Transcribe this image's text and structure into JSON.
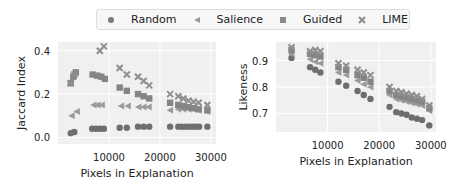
{
  "legend": {
    "items": [
      {
        "label": "Random",
        "marker": "circle"
      },
      {
        "label": "Salience",
        "marker": "triangle-left"
      },
      {
        "label": "Guided",
        "marker": "square"
      },
      {
        "label": "LIME",
        "marker": "x"
      }
    ]
  },
  "colors": {
    "marker": "#7a7a7a",
    "plot_bg": "#f0f0f0",
    "grid": "#ffffff"
  },
  "chart_data": [
    {
      "type": "scatter",
      "title": "",
      "xlabel": "Pixels in Explanation",
      "ylabel": "Jaccard Index",
      "xticks": [
        10000,
        20000,
        30000
      ],
      "yticks": [
        0.0,
        0.2,
        0.4
      ],
      "xlim": [
        0,
        31000
      ],
      "ylim": [
        -0.03,
        0.44
      ],
      "grid": true,
      "series": [
        {
          "name": "Random",
          "marker": "circle",
          "x": [
            2500,
            3200,
            6700,
            7500,
            8300,
            9000,
            12100,
            13500,
            15700,
            16800,
            17900,
            22000,
            23600,
            24300,
            25000,
            25700,
            26400,
            27000,
            27700,
            29300
          ],
          "y": [
            0.02,
            0.025,
            0.04,
            0.04,
            0.04,
            0.04,
            0.045,
            0.045,
            0.05,
            0.05,
            0.05,
            0.05,
            0.05,
            0.05,
            0.05,
            0.05,
            0.05,
            0.05,
            0.05,
            0.05
          ]
        },
        {
          "name": "Salience",
          "marker": "triangle-left",
          "x": [
            2700,
            3700,
            7000,
            7800,
            8600,
            12400,
            13700,
            15800,
            16800,
            17800,
            22000,
            23600,
            24600,
            25600,
            26600,
            27600,
            29300
          ],
          "y": [
            0.1,
            0.12,
            0.15,
            0.15,
            0.15,
            0.145,
            0.145,
            0.14,
            0.14,
            0.14,
            0.125,
            0.13,
            0.13,
            0.13,
            0.13,
            0.125,
            0.12
          ]
        },
        {
          "name": "Guided",
          "marker": "square",
          "x": [
            2500,
            3000,
            3500,
            6800,
            7700,
            8500,
            9200,
            12100,
            13500,
            15700,
            16800,
            17900,
            22000,
            23600,
            24600,
            25600,
            26600,
            27600,
            29300
          ],
          "y": [
            0.25,
            0.28,
            0.3,
            0.29,
            0.285,
            0.28,
            0.27,
            0.23,
            0.215,
            0.2,
            0.19,
            0.18,
            0.16,
            0.15,
            0.145,
            0.14,
            0.135,
            0.13,
            0.125
          ]
        },
        {
          "name": "LIME",
          "marker": "x",
          "x": [
            2500,
            3200,
            8200,
            9000,
            12100,
            13500,
            15700,
            16800,
            17900,
            22000,
            23600,
            24600,
            25600,
            26600,
            27600,
            29300
          ],
          "y": [
            0.25,
            0.29,
            0.4,
            0.42,
            0.32,
            0.29,
            0.28,
            0.26,
            0.24,
            0.2,
            0.19,
            0.18,
            0.17,
            0.165,
            0.16,
            0.15
          ]
        }
      ]
    },
    {
      "type": "scatter",
      "title": "",
      "xlabel": "Pixels in Explanation",
      "ylabel": "Likeness",
      "xticks": [
        10000,
        20000,
        30000
      ],
      "yticks": [
        0.7,
        0.8,
        0.9
      ],
      "xlim": [
        0,
        31000
      ],
      "ylim": [
        0.63,
        0.97
      ],
      "grid": true,
      "series": [
        {
          "name": "Random",
          "marker": "circle",
          "x": [
            3000,
            6600,
            7600,
            8600,
            12100,
            13600,
            15800,
            17000,
            18300,
            22000,
            23300,
            24300,
            25300,
            26300,
            27300,
            28300,
            29700
          ],
          "y": [
            0.91,
            0.875,
            0.865,
            0.855,
            0.82,
            0.805,
            0.785,
            0.77,
            0.755,
            0.725,
            0.705,
            0.7,
            0.695,
            0.685,
            0.68,
            0.675,
            0.655
          ]
        },
        {
          "name": "Salience",
          "marker": "triangle-left",
          "x": [
            3000,
            6600,
            7600,
            8600,
            12100,
            13600,
            15800,
            17000,
            18300,
            22000,
            23300,
            24300,
            25300,
            26300,
            27300,
            28300,
            29700
          ],
          "y": [
            0.925,
            0.905,
            0.895,
            0.89,
            0.855,
            0.845,
            0.825,
            0.81,
            0.8,
            0.77,
            0.755,
            0.75,
            0.745,
            0.74,
            0.735,
            0.73,
            0.71
          ]
        },
        {
          "name": "Guided",
          "marker": "square",
          "x": [
            3000,
            6600,
            7600,
            8600,
            12100,
            13600,
            15800,
            17000,
            18300,
            22000,
            23300,
            24300,
            25300,
            26300,
            27300,
            28300,
            29700
          ],
          "y": [
            0.94,
            0.925,
            0.92,
            0.915,
            0.875,
            0.865,
            0.845,
            0.835,
            0.82,
            0.785,
            0.77,
            0.765,
            0.76,
            0.755,
            0.75,
            0.745,
            0.72
          ]
        },
        {
          "name": "LIME",
          "marker": "x",
          "x": [
            3000,
            6600,
            7600,
            8600,
            12100,
            13600,
            15800,
            17000,
            18300,
            22000,
            23300,
            24300,
            25300,
            26300,
            27300,
            28300,
            29700
          ],
          "y": [
            0.95,
            0.935,
            0.94,
            0.935,
            0.89,
            0.88,
            0.865,
            0.855,
            0.845,
            0.8,
            0.785,
            0.78,
            0.775,
            0.77,
            0.765,
            0.755,
            0.73
          ]
        }
      ]
    }
  ]
}
